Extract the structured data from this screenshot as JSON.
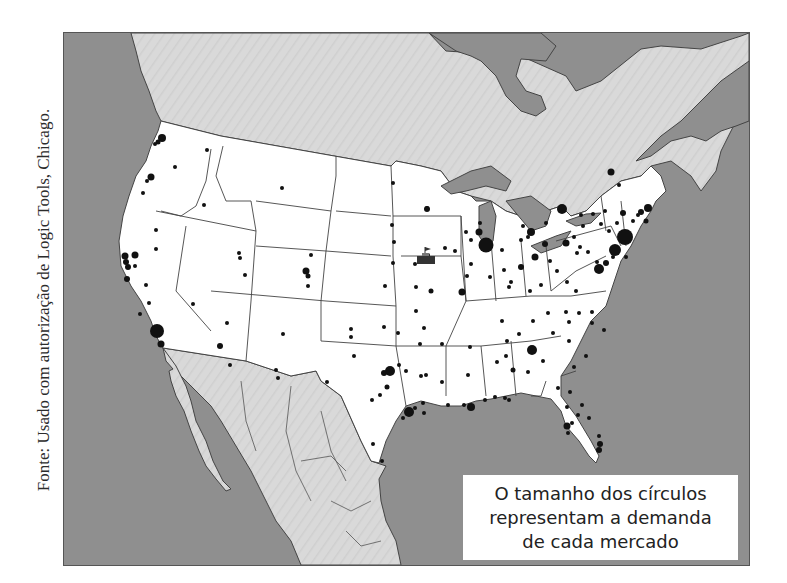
{
  "source": {
    "caption": "Fonte: Usado com autorização de Logic Tools, Chicago."
  },
  "map": {
    "title": "Mapa de demanda por mercado - América do Norte",
    "colors": {
      "ocean": "#8f8f8f",
      "foreign_land": "#d9d9d9",
      "usa_land": "#ffffff",
      "borders": "#444444",
      "markets": "#111111",
      "facility": "#333333"
    },
    "facility_marker": {
      "label": "facility-icon",
      "approx_location": "Iowa"
    }
  },
  "legend": {
    "lines": [
      "O tamanho dos círculos",
      "representam a demanda",
      "de cada mercado"
    ]
  }
}
